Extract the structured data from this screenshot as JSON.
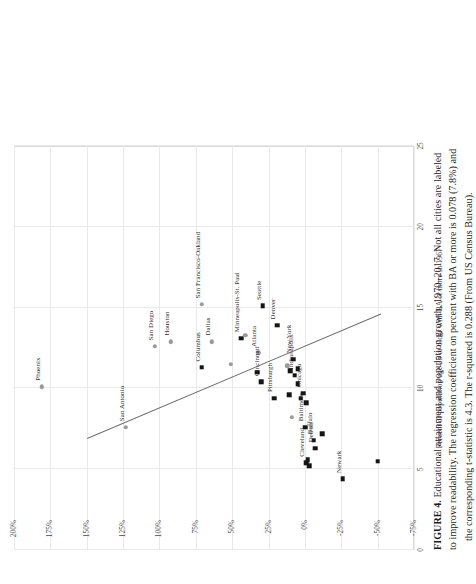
{
  "figure": {
    "caption_bold": "FIGURE 4.",
    "caption_line1": "Educational attainment and population growth, 1970–2017. Not all cities are labeled",
    "caption_line2": "to improve readability. The regression coefficient on percent with BA or more is 0.078 (7.8%) and",
    "caption_line3": "the corresponding t-statistic is 4.3. The r-squared is 0.288 (From US Census Bureau)."
  },
  "chart_data": {
    "type": "scatter",
    "title": "",
    "xlabel": "Percent of population age 25 or older with BA or more in 1967",
    "ylabel": "",
    "xlim": [
      0,
      25
    ],
    "ylim": [
      -75,
      200
    ],
    "xticks": [
      "0",
      "5",
      "10",
      "15",
      "20",
      "25"
    ],
    "yticks": [
      "200%",
      "175%",
      "150%",
      "125%",
      "100%",
      "75%",
      "50%",
      "25%",
      "0%",
      "-25%",
      "-50%",
      "-75%"
    ],
    "grid": true,
    "legend": "none",
    "marker_colors": {
      "circle": "#9a9a9a",
      "square": "#151515"
    },
    "trendline": {
      "label": "linear fit",
      "color": "#6d6d6d",
      "x1": 6.9,
      "y1": 150.0,
      "x2": 14.6,
      "y2": -52.0
    },
    "annotations": {
      "regression_coefficient": 0.078,
      "t_statistic": 4.3,
      "r_squared": 0.288
    },
    "points": [
      {
        "label": "Phoenix",
        "x": 10.1,
        "y": 181.0,
        "marker": "circle",
        "lx": 6,
        "ly": -3
      },
      {
        "label": "San Antonio",
        "x": 7.6,
        "y": 123.0,
        "marker": "circle",
        "lx": 6,
        "ly": -3
      },
      {
        "label": "San Diego",
        "x": 12.6,
        "y": 103.0,
        "marker": "circle",
        "lx": 6,
        "ly": -3
      },
      {
        "label": "Houston",
        "x": 12.9,
        "y": 92.0,
        "marker": "circle",
        "lx": 6,
        "ly": -3
      },
      {
        "label": "Columbus",
        "x": 11.3,
        "y": 71.0,
        "marker": "square",
        "lx": 6,
        "ly": -3
      },
      {
        "label": "Dallas",
        "x": 12.9,
        "y": 64.0,
        "marker": "circle",
        "lx": 6,
        "ly": -3
      },
      {
        "label": "Seattle",
        "x": 15.1,
        "y": 29.0,
        "marker": "square",
        "lx": 6,
        "ly": -3
      },
      {
        "label": "San Francisco-Oakland",
        "x": 15.2,
        "y": 71.0,
        "marker": "circle",
        "lx": 6,
        "ly": -3
      },
      {
        "label": "Minneapolis-St. Paul",
        "x": 13.1,
        "y": 44.0,
        "marker": "square",
        "lx": 6,
        "ly": -3
      },
      {
        "label": "Denver",
        "x": 13.9,
        "y": 19.0,
        "marker": "square",
        "lx": 6,
        "ly": -3
      },
      {
        "label": "Atlanta",
        "x": 12.2,
        "y": 32.0,
        "marker": "circle",
        "lx": 6,
        "ly": -3
      },
      {
        "label": "Cincinnati",
        "x": 10.4,
        "y": 30.0,
        "marker": "square",
        "lx": 6,
        "ly": -3
      },
      {
        "label": "Indianapolis",
        "x": 10.8,
        "y": 7.0,
        "marker": "square",
        "lx": 6,
        "ly": -3
      },
      {
        "label": "New York",
        "x": 11.8,
        "y": 8.0,
        "marker": "square",
        "lx": 6,
        "ly": -3
      },
      {
        "label": "Chicago",
        "x": 9.7,
        "y": 1.0,
        "marker": "square",
        "lx": 6,
        "ly": -3
      },
      {
        "label": "Pittsburgh",
        "x": 9.4,
        "y": 21.0,
        "marker": "square",
        "lx": 6,
        "ly": -3
      },
      {
        "label": "Baltimore",
        "x": 7.6,
        "y": 0.0,
        "marker": "square",
        "lx": 6,
        "ly": -3
      },
      {
        "label": "Buffalo",
        "x": 6.8,
        "y": -6.0,
        "marker": "square",
        "lx": 6,
        "ly": -3
      },
      {
        "label": "Detroit",
        "x": 6.3,
        "y": -7.0,
        "marker": "square",
        "lx": 6,
        "ly": -3
      },
      {
        "label": "Cleveland",
        "x": 5.4,
        "y": -1.0,
        "marker": "square",
        "lx": 6,
        "ly": -3
      },
      {
        "label": "Newark",
        "x": 4.4,
        "y": -26.0,
        "marker": "square",
        "lx": 6,
        "ly": -3
      },
      {
        "label": "",
        "x": 11.5,
        "y": 51.0,
        "marker": "circle"
      },
      {
        "label": "",
        "x": 13.3,
        "y": 41.0,
        "marker": "circle"
      },
      {
        "label": "",
        "x": 11.4,
        "y": 12.0,
        "marker": "circle"
      },
      {
        "label": "",
        "x": 11.1,
        "y": 10.0,
        "marker": "square"
      },
      {
        "label": "",
        "x": 11.2,
        "y": 5.0,
        "marker": "square"
      },
      {
        "label": "",
        "x": 10.3,
        "y": 5.0,
        "marker": "square"
      },
      {
        "label": "",
        "x": 9.6,
        "y": 11.0,
        "marker": "square"
      },
      {
        "label": "",
        "x": 9.4,
        "y": 3.0,
        "marker": "square"
      },
      {
        "label": "",
        "x": 9.1,
        "y": -1.0,
        "marker": "square"
      },
      {
        "label": "",
        "x": 8.2,
        "y": 9.0,
        "marker": "circle"
      },
      {
        "label": "",
        "x": 7.2,
        "y": -12.0,
        "marker": "square"
      },
      {
        "label": "",
        "x": 5.6,
        "y": -2.0,
        "marker": "square"
      },
      {
        "label": "",
        "x": 5.2,
        "y": -3.0,
        "marker": "square"
      },
      {
        "label": "",
        "x": 5.5,
        "y": -50.0,
        "marker": "square"
      },
      {
        "label": "",
        "x": 11.0,
        "y": 33.0,
        "marker": "square"
      }
    ]
  }
}
